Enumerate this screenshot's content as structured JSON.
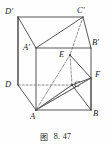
{
  "figure": {
    "caption_label": "图",
    "caption_number": "8. 47",
    "line_color": "#3a3a3a",
    "dash_color": "#6b6b6b",
    "background": "#fefefe",
    "text_color": "#1b1b1b"
  },
  "vertices": [
    {
      "id": "Dp",
      "label": "D'",
      "x": 18,
      "y": 17,
      "lx": 5,
      "ly": 7,
      "hidden": false
    },
    {
      "id": "Cp",
      "label": "C'",
      "x": 83,
      "y": 17,
      "lx": 77,
      "ly": 6,
      "hidden": false
    },
    {
      "id": "Ap",
      "label": "A'",
      "x": 36,
      "y": 48,
      "lx": 23,
      "ly": 43,
      "hidden": false
    },
    {
      "id": "Bp",
      "label": "B'",
      "x": 91,
      "y": 48,
      "lx": 92,
      "ly": 38,
      "hidden": false
    },
    {
      "id": "D",
      "label": "D",
      "x": 18,
      "y": 85,
      "lx": 5,
      "ly": 80,
      "hidden": false
    },
    {
      "id": "C",
      "label": "C",
      "x": 72,
      "y": 85,
      "lx": 74,
      "ly": 80,
      "hidden": false
    },
    {
      "id": "A",
      "label": "A",
      "x": 36,
      "y": 110,
      "lx": 30,
      "ly": 112,
      "hidden": false
    },
    {
      "id": "B",
      "label": "B",
      "x": 91,
      "y": 110,
      "lx": 93,
      "ly": 109,
      "hidden": false
    },
    {
      "id": "E",
      "label": "E",
      "x": 70,
      "y": 55,
      "lx": 59,
      "ly": 50,
      "hidden": false
    },
    {
      "id": "F",
      "label": "F",
      "x": 91,
      "y": 78,
      "lx": 95,
      "ly": 70,
      "hidden": false
    }
  ],
  "edges": [
    {
      "from": "Dp",
      "to": "Cp",
      "style": "solid",
      "name": "edge-Dp-Cp"
    },
    {
      "from": "Dp",
      "to": "Ap",
      "style": "solid",
      "name": "edge-Dp-Ap"
    },
    {
      "from": "Ap",
      "to": "Cp",
      "style": "solid",
      "name": "edge-Ap-Cp"
    },
    {
      "from": "Ap",
      "to": "Bp",
      "style": "solid",
      "name": "edge-Ap-Bp"
    },
    {
      "from": "Cp",
      "to": "Bp",
      "style": "solid",
      "name": "edge-Cp-Bp"
    },
    {
      "from": "Dp",
      "to": "D",
      "style": "solid",
      "name": "edge-Dp-D"
    },
    {
      "from": "Ap",
      "to": "A",
      "style": "solid",
      "name": "edge-Ap-A"
    },
    {
      "from": "Bp",
      "to": "B",
      "style": "solid",
      "name": "edge-Bp-B"
    },
    {
      "from": "Cp",
      "to": "E",
      "style": "dashed",
      "name": "edge-Cp-E"
    },
    {
      "from": "E",
      "to": "C",
      "style": "dashed",
      "name": "edge-E-C"
    },
    {
      "from": "D",
      "to": "C",
      "style": "dashed",
      "name": "edge-D-C"
    },
    {
      "from": "D",
      "to": "A",
      "style": "solid",
      "name": "edge-D-A"
    },
    {
      "from": "A",
      "to": "B",
      "style": "solid",
      "name": "edge-A-B"
    },
    {
      "from": "B",
      "to": "F",
      "style": "solid",
      "name": "edge-B-F"
    },
    {
      "from": "C",
      "to": "B",
      "style": "solid",
      "name": "edge-C-B"
    },
    {
      "from": "C",
      "to": "F",
      "style": "solid",
      "name": "edge-C-F"
    },
    {
      "from": "A",
      "to": "C",
      "style": "solid",
      "name": "edge-A-C"
    },
    {
      "from": "A",
      "to": "F",
      "style": "solid",
      "name": "edge-A-F"
    },
    {
      "from": "E",
      "to": "F",
      "style": "solid",
      "name": "edge-E-F"
    },
    {
      "from": "A",
      "to": "E",
      "style": "dashdot",
      "name": "edge-A-E"
    }
  ],
  "extra_segments": [
    {
      "x1": 36,
      "y1": 110,
      "x2": 72,
      "y2": 85,
      "style": "dashdot",
      "name": "segment-A-C-construction"
    },
    {
      "x1": 36,
      "y1": 110,
      "x2": 91,
      "y2": 78,
      "style": "dashdot",
      "name": "segment-A-F-construction"
    },
    {
      "x1": 18,
      "y1": 85,
      "x2": 18,
      "y2": 17,
      "style": "solid",
      "name": "segment-left-vertical"
    }
  ]
}
